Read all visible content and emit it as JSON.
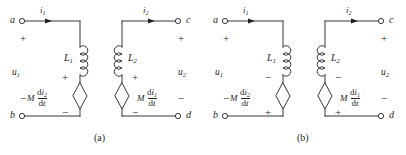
{
  "figure": {
    "type": "circuit-diagram",
    "panels": [
      {
        "id": "a",
        "caption": "(a)",
        "terminals": {
          "top_left": "a",
          "bottom_left": "b",
          "top_right": "c",
          "bottom_right": "d"
        },
        "currents": {
          "left": "i",
          "left_sub": "1",
          "right": "i",
          "right_sub": "2"
        },
        "port_voltages": {
          "left": "u",
          "left_sub": "1",
          "left_top_sign": "+",
          "left_bottom_sign": "−",
          "right": "u",
          "right_sub": "2",
          "right_top_sign": "+",
          "right_bottom_sign": "−"
        },
        "inductors": {
          "left_label": "L",
          "left_sub": "1",
          "right_label": "L",
          "right_sub": "2"
        },
        "sources": {
          "left": {
            "coefficient": "M",
            "numerator": "d",
            "numerator_var": "i",
            "numerator_sub": "2",
            "denominator": "d",
            "denominator_var": "t",
            "top_sign": "+",
            "bottom_sign": "−"
          },
          "right": {
            "coefficient": "M",
            "numerator": "d",
            "numerator_var": "i",
            "numerator_sub": "1",
            "denominator": "d",
            "denominator_var": "t",
            "top_sign": "+",
            "bottom_sign": "−"
          }
        }
      },
      {
        "id": "b",
        "caption": "(b)",
        "terminals": {
          "top_left": "a",
          "bottom_left": "b",
          "top_right": "c",
          "bottom_right": "d"
        },
        "currents": {
          "left": "i",
          "left_sub": "1",
          "right": "i",
          "right_sub": "2"
        },
        "port_voltages": {
          "left": "u",
          "left_sub": "1",
          "left_top_sign": "+",
          "left_bottom_sign": "−",
          "right": "u",
          "right_sub": "2",
          "right_top_sign": "+",
          "right_bottom_sign": "−"
        },
        "inductors": {
          "left_label": "L",
          "left_sub": "1",
          "right_label": "L",
          "right_sub": "2"
        },
        "sources": {
          "left": {
            "coefficient": "M",
            "numerator": "d",
            "numerator_var": "i",
            "numerator_sub": "2",
            "denominator": "d",
            "denominator_var": "t",
            "top_sign": "−",
            "bottom_sign": "+"
          },
          "right": {
            "coefficient": "M",
            "numerator": "d",
            "numerator_var": "i",
            "numerator_sub": "1",
            "denominator": "d",
            "denominator_var": "t",
            "top_sign": "−",
            "bottom_sign": "+"
          }
        }
      }
    ],
    "colors": {
      "ink": "#231f20",
      "background": "#ffffff"
    }
  }
}
